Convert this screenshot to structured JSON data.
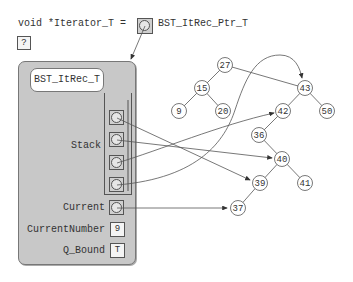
{
  "header": {
    "declaration": "void *Iterator_T =",
    "unknown_value": "?",
    "pointer_type_label": "BST_ItRec_Ptr_T"
  },
  "record": {
    "type_name": "BST_ItRec_T",
    "fields": {
      "stack_label": "Stack",
      "current_label": "Current",
      "current_number_label": "CurrentNumber",
      "current_number_value": "9",
      "q_bound_label": "Q_Bound",
      "q_bound_value": "T"
    },
    "stack_slots": [
      "43",
      "40",
      "42",
      "39"
    ],
    "current_points_to": "37"
  },
  "tree": {
    "nodes": [
      {
        "id": "27",
        "label": "27"
      },
      {
        "id": "15",
        "label": "15"
      },
      {
        "id": "9",
        "label": "9"
      },
      {
        "id": "20",
        "label": "20"
      },
      {
        "id": "43",
        "label": "43"
      },
      {
        "id": "42",
        "label": "42"
      },
      {
        "id": "50",
        "label": "50"
      },
      {
        "id": "36",
        "label": "36"
      },
      {
        "id": "40",
        "label": "40"
      },
      {
        "id": "39",
        "label": "39"
      },
      {
        "id": "41",
        "label": "41"
      },
      {
        "id": "37",
        "label": "37"
      }
    ],
    "edges": [
      [
        "27",
        "15"
      ],
      [
        "15",
        "9"
      ],
      [
        "15",
        "20"
      ],
      [
        "27",
        "43"
      ],
      [
        "43",
        "42"
      ],
      [
        "43",
        "50"
      ],
      [
        "42",
        "36"
      ],
      [
        "36",
        "40"
      ],
      [
        "40",
        "39"
      ],
      [
        "40",
        "41"
      ],
      [
        "39",
        "37"
      ]
    ]
  },
  "colors": {
    "record_fill": "#c8c8c8",
    "line": "#555555",
    "node_fill": "#ffffff"
  }
}
